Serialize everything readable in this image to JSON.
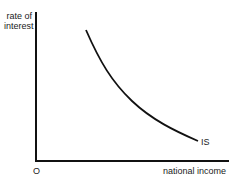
{
  "diagram": {
    "y_axis_label_line1": "rate of",
    "y_axis_label_line2": "interest",
    "x_axis_label": "national income",
    "origin_label": "O",
    "curve_label": "IS",
    "curve_color": "#111111",
    "axis_color": "#111111"
  }
}
